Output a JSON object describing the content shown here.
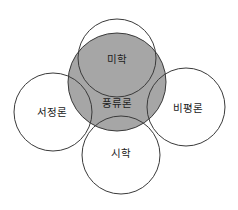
{
  "diagram": {
    "type": "venn-overlap",
    "colors": {
      "center_fill": "#a6a6a6",
      "stroke": "#3a3a3a",
      "text": "#222222",
      "background": "#ffffff"
    },
    "center": {
      "label": "풍류론",
      "cx": 117,
      "cy": 82,
      "r": 49,
      "label_x": 117,
      "label_y": 107
    },
    "circles": [
      {
        "id": "top",
        "label": "미학",
        "cx": 117,
        "cy": 58,
        "r": 39,
        "label_x": 117,
        "label_y": 63
      },
      {
        "id": "left",
        "label": "서정론",
        "cx": 53,
        "cy": 112,
        "r": 39,
        "label_x": 52,
        "label_y": 116
      },
      {
        "id": "right",
        "label": "비평론",
        "cx": 186,
        "cy": 107,
        "r": 39,
        "label_x": 188,
        "label_y": 112
      },
      {
        "id": "bottom",
        "label": "시학",
        "cx": 121,
        "cy": 155,
        "r": 39,
        "label_x": 121,
        "label_y": 157
      }
    ]
  }
}
